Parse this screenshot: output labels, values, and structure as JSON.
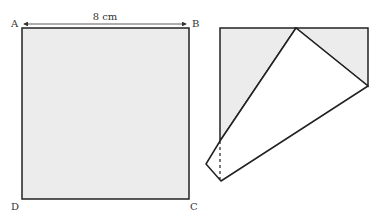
{
  "square": {
    "vertices": {
      "A": "A",
      "B": "B",
      "C": "C",
      "D": "D"
    },
    "side_label": "8 cm",
    "fill": "#ececec",
    "stroke": "#222222"
  },
  "folded_figure": {
    "shaded_fill": "#ececec",
    "unshaded_fill": "#ffffff",
    "stroke": "#222222",
    "dashed_line": true
  }
}
